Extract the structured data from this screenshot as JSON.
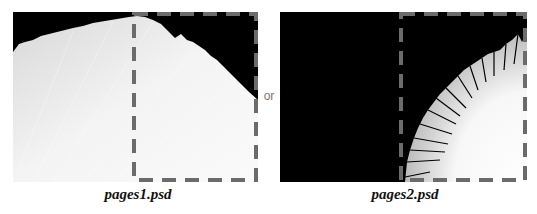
{
  "panels": [
    {
      "filename": "pages1.psd",
      "description": "fanned white pages filling most of the frame, black top-right corner"
    },
    {
      "filename": "pages2.psd",
      "description": "black frame with fanned white pages in the bottom-right quadrant"
    }
  ],
  "separator": "or",
  "colors": {
    "background": "#ffffff",
    "image_bg": "#000000",
    "dash": "#6b6b6b",
    "pages": "#f2f2f2"
  }
}
